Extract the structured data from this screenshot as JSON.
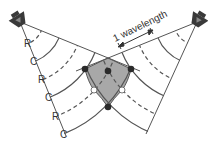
{
  "diagram": {
    "title_label": "1 wavelength",
    "colors": {
      "line": "#555555",
      "speaker": "#3a3a3a",
      "speaker_inner": "#888888",
      "overlap_fill": "#a8a8a8",
      "node_dark": "#2a2a2a",
      "node_light": "#ffffff"
    },
    "sources": [
      {
        "name": "left-speaker",
        "x": 20,
        "y": 22
      },
      {
        "name": "right-speaker",
        "x": 197,
        "y": 22
      }
    ],
    "left_labels": [
      {
        "text": "R",
        "x": 24,
        "y": 47
      },
      {
        "text": "C",
        "x": 30,
        "y": 65
      },
      {
        "text": "R",
        "x": 38,
        "y": 83
      },
      {
        "text": "C",
        "x": 45,
        "y": 101
      },
      {
        "text": "R",
        "x": 52,
        "y": 120
      },
      {
        "text": "C",
        "x": 60,
        "y": 138
      }
    ],
    "legend": {
      "R": "rarefaction (dashed arc)",
      "C": "compression (solid arc)"
    }
  }
}
